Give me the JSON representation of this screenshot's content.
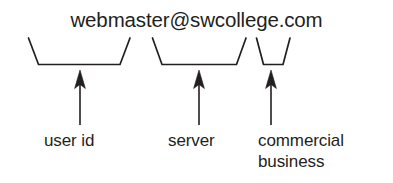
{
  "diagram": {
    "email_address": "webmaster@swcollege.com",
    "ink_color": "#231f20",
    "background_color": "#ffffff",
    "parts": [
      {
        "segment_text": "webmaster",
        "label": "user id",
        "label_lines": [
          "user id"
        ],
        "brace_left_x": 28,
        "brace_right_x": 130,
        "arrow_x": 80
      },
      {
        "segment_text": "swcollege",
        "label": "server",
        "label_lines": [
          "server"
        ],
        "brace_left_x": 152,
        "brace_right_x": 246,
        "arrow_x": 199
      },
      {
        "segment_text": "com",
        "label": "commercial business",
        "label_lines": [
          "commercial",
          "business"
        ],
        "brace_left_x": 256,
        "brace_right_x": 290,
        "arrow_x": 271
      }
    ],
    "labels": {
      "user_id": "user id",
      "server": "server",
      "commercial_line1": "commercial",
      "commercial_line2": "business"
    }
  }
}
